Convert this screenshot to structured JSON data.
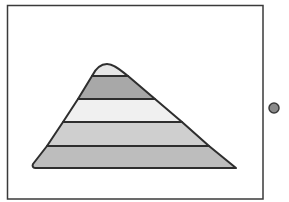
{
  "diagram": {
    "type": "layered-pyramid",
    "frame": {
      "x": 7,
      "y": 5,
      "width": 256,
      "height": 194,
      "stroke": "#3a3a3a"
    },
    "pyramid": {
      "outline": "#2e2e2e",
      "layers": [
        {
          "name": "layer-1-top",
          "fill": "#e6e6e6"
        },
        {
          "name": "layer-2",
          "fill": "#a8a8a8"
        },
        {
          "name": "layer-3",
          "fill": "#f0f0f0"
        },
        {
          "name": "layer-4",
          "fill": "#cfcfcf"
        },
        {
          "name": "layer-5-bottom",
          "fill": "#bdbdbd"
        }
      ]
    },
    "side_marker": {
      "cx": 274,
      "cy": 108,
      "r": 5,
      "fill": "#8a8a8a",
      "stroke": "#3a3a3a"
    }
  }
}
